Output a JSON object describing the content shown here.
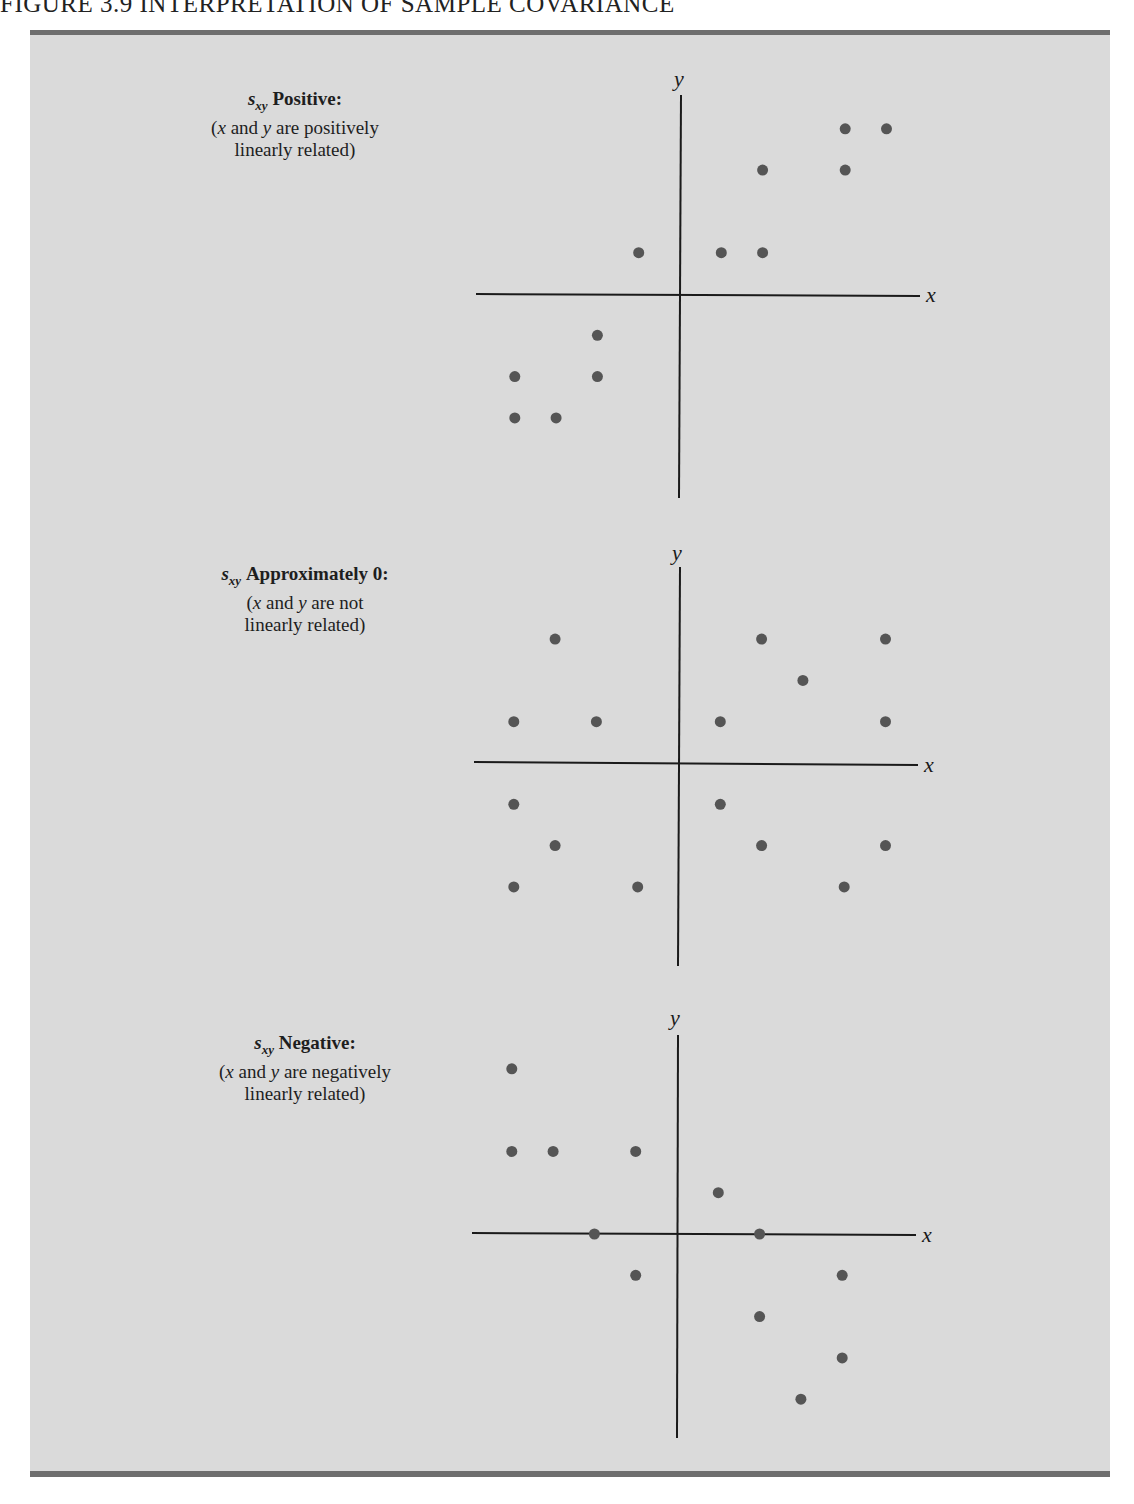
{
  "figure": {
    "title": "FIGURE 3.9    INTERPRETATION OF SAMPLE COVARIANCE",
    "background": "#dadada",
    "point_color": "#555555",
    "axis_color": "#1a1a1a"
  },
  "panels": [
    {
      "stat": "s",
      "stat_sub": "xy",
      "heading": "Positive:",
      "desc_open": "(",
      "desc_x": "x",
      "desc_and": " and ",
      "desc_y": "y",
      "desc_rest": " are positively",
      "desc_line2": "linearly related)",
      "x_axis_label": "x",
      "y_axis_label": "y"
    },
    {
      "stat": "s",
      "stat_sub": "xy",
      "heading": "Approximately 0:",
      "desc_open": "(",
      "desc_x": "x",
      "desc_and": " and ",
      "desc_y": "y",
      "desc_rest": " are not",
      "desc_line2": "linearly related)",
      "x_axis_label": "x",
      "y_axis_label": "y"
    },
    {
      "stat": "s",
      "stat_sub": "xy",
      "heading": "Negative:",
      "desc_open": "(",
      "desc_x": "x",
      "desc_and": " and ",
      "desc_y": "y",
      "desc_rest": " are negatively",
      "desc_line2": "linearly related)",
      "x_axis_label": "x",
      "y_axis_label": "y"
    }
  ],
  "chart_data": [
    {
      "type": "scatter",
      "title": "s_xy Positive: (x and y are positively linearly related)",
      "xlabel": "x",
      "ylabel": "y",
      "grid": false,
      "xlim": [
        -5,
        6
      ],
      "ylim": [
        -5,
        5.5
      ],
      "points": [
        [
          -1,
          1
        ],
        [
          1,
          1
        ],
        [
          2,
          1
        ],
        [
          2,
          3
        ],
        [
          4,
          3
        ],
        [
          4,
          4
        ],
        [
          5,
          4
        ],
        [
          -2,
          -1
        ],
        [
          -4,
          -2
        ],
        [
          -2,
          -2
        ],
        [
          -4,
          -3
        ],
        [
          -3,
          -3
        ]
      ]
    },
    {
      "type": "scatter",
      "title": "s_xy Approximately 0: (x and y are not linearly related)",
      "xlabel": "x",
      "ylabel": "y",
      "grid": false,
      "xlim": [
        -5,
        6
      ],
      "ylim": [
        -5,
        5.5
      ],
      "points": [
        [
          -3,
          3
        ],
        [
          2,
          3
        ],
        [
          5,
          3
        ],
        [
          3,
          2
        ],
        [
          -4,
          1
        ],
        [
          -2,
          1
        ],
        [
          1,
          1
        ],
        [
          5,
          1
        ],
        [
          -4,
          -1
        ],
        [
          1,
          -1
        ],
        [
          -3,
          -2
        ],
        [
          2,
          -2
        ],
        [
          5,
          -2
        ],
        [
          -4,
          -3
        ],
        [
          -1,
          -3
        ],
        [
          4,
          -3
        ]
      ]
    },
    {
      "type": "scatter",
      "title": "s_xy Negative: (x and y are negatively linearly related)",
      "xlabel": "x",
      "ylabel": "y",
      "grid": false,
      "xlim": [
        -5,
        6
      ],
      "ylim": [
        -5,
        5.5
      ],
      "points": [
        [
          -4,
          4
        ],
        [
          -4,
          2
        ],
        [
          -3,
          2
        ],
        [
          -1,
          2
        ],
        [
          1,
          1
        ],
        [
          -2,
          0
        ],
        [
          2,
          0
        ],
        [
          -1,
          -1
        ],
        [
          4,
          -1
        ],
        [
          2,
          -2
        ],
        [
          4,
          -3
        ],
        [
          3,
          -4
        ]
      ]
    }
  ]
}
